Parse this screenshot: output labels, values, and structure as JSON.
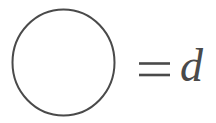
{
  "figure": {
    "kind": "math-notation-diagram",
    "background_color": "#ffffff",
    "stroke_color": "#4a4a4a",
    "text_color": "#4a4a4a",
    "equation_text": "= d",
    "shape": {
      "name": "circle",
      "center_x": 63.5,
      "center_y": 62.5,
      "radius_x": 51,
      "radius_y": 53,
      "stroke_width": 2.0
    },
    "equals_sign": {
      "label": "=",
      "x_start": 139,
      "x_end": 170,
      "bar_top_y": 63,
      "bar_bottom_y": 75,
      "stroke_width": 2.6
    },
    "variable": {
      "label": "d",
      "meaning": "diameter",
      "x": 180,
      "baseline_y": 81,
      "font_size": 46,
      "style": "italic-serif"
    }
  }
}
